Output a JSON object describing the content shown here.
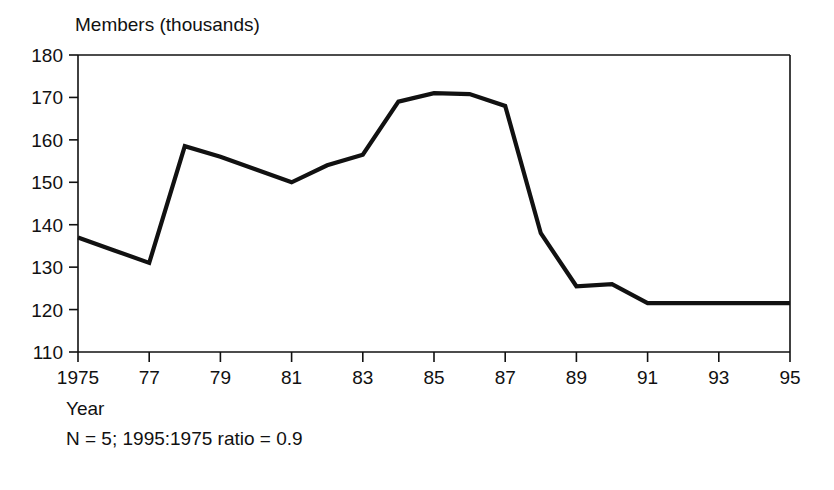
{
  "chart_data": {
    "type": "line",
    "title": "Members (thousands)",
    "xlabel": "Year",
    "ylabel": "Members (thousands)",
    "xlim": [
      1975,
      1995
    ],
    "ylim": [
      110,
      180
    ],
    "grid": false,
    "legend": "none",
    "x_tick_labels": [
      "1975",
      "77",
      "79",
      "81",
      "83",
      "85",
      "87",
      "89",
      "91",
      "93",
      "95"
    ],
    "x_tick_values": [
      1975,
      1977,
      1979,
      1981,
      1983,
      1985,
      1987,
      1989,
      1991,
      1993,
      1995
    ],
    "y_tick_labels": [
      "110",
      "120",
      "130",
      "140",
      "150",
      "160",
      "170",
      "180"
    ],
    "y_tick_values": [
      110,
      120,
      130,
      140,
      150,
      160,
      170,
      180
    ],
    "x": [
      1975,
      1976,
      1977,
      1978,
      1979,
      1980,
      1981,
      1982,
      1983,
      1984,
      1985,
      1986,
      1987,
      1988,
      1989,
      1990,
      1991,
      1992,
      1993,
      1994,
      1995
    ],
    "values": [
      137,
      134,
      131,
      158.5,
      156,
      153,
      150,
      154,
      156.5,
      169,
      171,
      170.8,
      168,
      138,
      125.5,
      126,
      121.5,
      121.5,
      121.5,
      121.5,
      121.5
    ],
    "series": [
      {
        "name": "Members",
        "color": "#111111",
        "values": [
          137,
          134,
          131,
          158.5,
          156,
          153,
          150,
          154,
          156.5,
          169,
          171,
          170.8,
          168,
          138,
          125.5,
          126,
          121.5,
          121.5,
          121.5,
          121.5,
          121.5
        ]
      }
    ],
    "annotations": [
      "N = 5; 1995:1975 ratio = 0.9"
    ]
  },
  "footnote": "N = 5; 1995:1975 ratio = 0.9",
  "colors": {
    "line": "#111111",
    "axis": "#111111",
    "background": "#ffffff"
  }
}
